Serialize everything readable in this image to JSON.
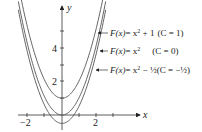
{
  "chart_data": {
    "type": "line",
    "title": "",
    "xlabel": "x",
    "ylabel": "y",
    "xlim": [
      -2.4,
      4.6
    ],
    "ylim": [
      -0.8,
      6.3
    ],
    "x_ticks": [
      -2,
      -1,
      0,
      1,
      2,
      3
    ],
    "x_tick_labels": [
      "-2",
      "2"
    ],
    "y_ticks": [
      1,
      2,
      3,
      4,
      5
    ],
    "y_tick_labels": [
      "2",
      "4"
    ],
    "grid": false,
    "series": [
      {
        "name": "F(x) = x^2 + 1 (C = 1)",
        "formula": "x^2 + 1",
        "C": 1
      },
      {
        "name": "F(x) = x^2 (C = 0)",
        "formula": "x^2",
        "C": 0
      },
      {
        "name": "F(x) = x^2 - 1/2 (C = -1/2)",
        "formula": "x^2 - 1/2",
        "C": -0.5
      }
    ],
    "annotations": [
      "F(x) = x² + 1 (C = 1)",
      "F(x) = x²     (C = 0)",
      "F(x) = x² − ½ (C = −½)"
    ]
  },
  "axes": {
    "x_label": "x",
    "y_label": "y",
    "x_tick_neg2": "−2",
    "x_tick_2": "2",
    "y_tick_2": "2",
    "y_tick_4": "4"
  },
  "labels": {
    "c1": {
      "F": "F(x)",
      "eq": "= x",
      "exp": "2",
      "rest": " + 1",
      "c": "(C = 1)"
    },
    "c0": {
      "F": "F(x)",
      "eq": "= x",
      "exp": "2",
      "rest": "",
      "c": "(C = 0)"
    },
    "cm": {
      "F": "F(x)",
      "eq": "= x",
      "exp": "2",
      "rest": " − ½",
      "c": "(C = −½)"
    }
  },
  "colors": {
    "axis": "#333333",
    "curve": "#555555",
    "text": "#222222"
  }
}
